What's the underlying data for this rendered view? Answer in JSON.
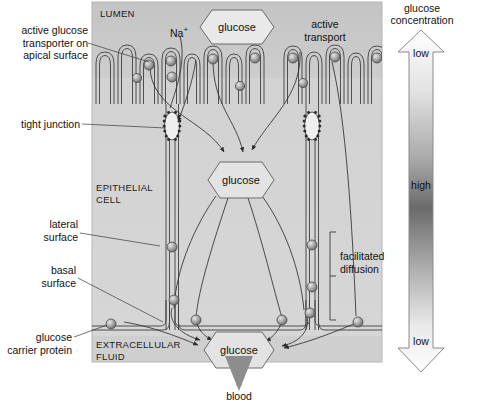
{
  "figure": {
    "title_hidden": "",
    "panel": {
      "regions": [
        {
          "name": "lumen",
          "label": "LUMEN"
        },
        {
          "name": "epithelial-cell",
          "label": "EPITHELIAL\nCELL"
        },
        {
          "name": "extracellular-fluid",
          "label": "EXTRACELLULAR\nFLUID"
        }
      ]
    }
  },
  "left_labels": [
    {
      "id": "active-glucose-transporter",
      "text": "active glucose\ntransporter on\napical surface"
    },
    {
      "id": "tight-junction",
      "text": "tight junction"
    },
    {
      "id": "lateral-surface",
      "text": "lateral\nsurface"
    },
    {
      "id": "basal-surface",
      "text": "basal\nsurface"
    },
    {
      "id": "glucose-carrier-protein",
      "text": "glucose\ncarrier protein"
    }
  ],
  "inner_labels": [
    {
      "id": "sodium-ion",
      "text": "Na+",
      "display": "Na"
    },
    {
      "id": "sodium-superscript",
      "text": "+"
    },
    {
      "id": "active-transport",
      "text": "active\ntransport"
    },
    {
      "id": "facilitated-diffusion",
      "text": "facilitated\ndiffusion"
    }
  ],
  "molecules": [
    {
      "id": "glucose-lumen",
      "label": "glucose"
    },
    {
      "id": "glucose-cytosol",
      "label": "glucose"
    },
    {
      "id": "glucose-extracellular",
      "label": "glucose"
    }
  ],
  "outflow": {
    "id": "blood",
    "label": "blood"
  },
  "scale": {
    "title": "glucose\nconcentration",
    "title_line1": "glucose",
    "title_line2": "concentration",
    "top_label": "low",
    "middle_label": "high",
    "bottom_label": "low",
    "gradient_stops": [
      "#ffffff",
      "#bdbdbd",
      "#5a5a5a",
      "#9a9a9a",
      "#ffffff"
    ]
  },
  "colors": {
    "lumen_bg": "#c9c9c9",
    "cell_bg": "#d4d4d4",
    "extracellular_bg": "#cfcfcf",
    "panel_border": "#b9b9b9",
    "membrane_line": "#3b3b3b",
    "carrier_fill": "#9e9e9e",
    "arrow_gray": "#8d8d8d",
    "text": "#111111"
  }
}
